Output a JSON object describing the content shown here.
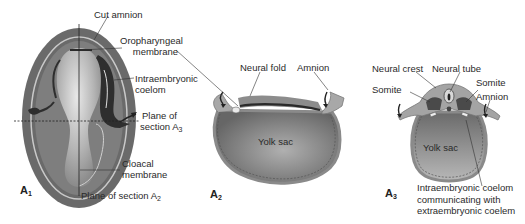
{
  "figure": {
    "panels": [
      {
        "id": "A1",
        "id_letter": "A",
        "id_sub": "1",
        "description": "Dorsal view of embryo with cut amnion",
        "labels": {
          "cut_amnion": "Cut amnion",
          "oropharyngeal_1": "Oropharyngeal",
          "oropharyngeal_2": "membrane",
          "intraembryonic_1": "Intraembryonic",
          "intraembryonic_2": "coelom",
          "plane_a3_1": "Plane of",
          "plane_a3_2": "section A",
          "plane_a3_sub": "3",
          "cloacal_1": "Cloacal",
          "cloacal_2": "membrane",
          "plane_a2": "Plane of section A",
          "plane_a2_sub": "2"
        }
      },
      {
        "id": "A2",
        "id_letter": "A",
        "id_sub": "2",
        "description": "Longitudinal section",
        "labels": {
          "neural_fold": "Neural fold",
          "amnion": "Amnion",
          "yolk_sac": "Yolk sac"
        }
      },
      {
        "id": "A3",
        "id_letter": "A",
        "id_sub": "3",
        "description": "Transverse section",
        "labels": {
          "neural_crest": "Neural crest",
          "neural_tube": "Neural tube",
          "somite_left": "Somite",
          "somite_right": "Somite",
          "amnion": "Amnion",
          "yolk_sac": "Yolk sac",
          "coelom_1": "Intraembryonic coelom",
          "coelom_2": "communicating with",
          "coelom_3": "extraembryonic coelem"
        }
      }
    ],
    "colors": {
      "outer_tissue": "#6e6e6e",
      "mid_tissue": "#9a9a9a",
      "light_tissue": "#c8c8c8",
      "dark_tissue": "#3c3c3c",
      "yolk": "#8c8c8c",
      "leader_line": "#333333"
    }
  }
}
